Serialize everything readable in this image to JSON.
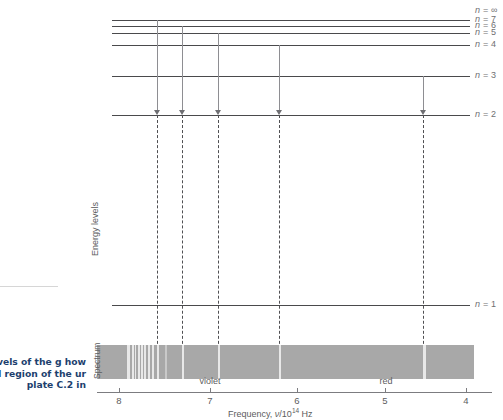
{
  "figure": {
    "energy_axis_label": "Energy levels",
    "spectrum_label": "Spectrum",
    "freq_axis_title_prefix": "Frequency, ",
    "freq_axis_title_nu": "ν",
    "freq_axis_title_denom": "/10",
    "freq_axis_title_exp": "14",
    "freq_axis_title_unit": " Hz",
    "caption": "y levels of the g how coloured region of the ur plate C.2 in"
  },
  "levels": [
    {
      "label_n": "n",
      "label_eq": " = ",
      "label_val": "∞",
      "y": 11,
      "x1": 112,
      "x2": 470,
      "drawn": false
    },
    {
      "label_n": "n",
      "label_eq": " = ",
      "label_val": "7",
      "y": 20,
      "x1": 112,
      "x2": 470,
      "drawn": true
    },
    {
      "label_n": "n",
      "label_eq": " = ",
      "label_val": "6",
      "y": 26,
      "x1": 112,
      "x2": 470,
      "drawn": true
    },
    {
      "label_n": "n",
      "label_eq": " = ",
      "label_val": "5",
      "y": 33,
      "x1": 112,
      "x2": 470,
      "drawn": true
    },
    {
      "label_n": "n",
      "label_eq": " = ",
      "label_val": "4",
      "y": 45,
      "x1": 112,
      "x2": 470,
      "drawn": true
    },
    {
      "label_n": "n",
      "label_eq": " = ",
      "label_val": "3",
      "y": 76,
      "x1": 112,
      "x2": 470,
      "drawn": true
    },
    {
      "label_n": "n",
      "label_eq": " = ",
      "label_val": "2",
      "y": 115,
      "x1": 112,
      "x2": 470,
      "drawn": true
    },
    {
      "label_n": "n",
      "label_eq": " = ",
      "label_val": "1",
      "y": 305,
      "x1": 112,
      "x2": 470,
      "drawn": true
    }
  ],
  "transitions": [
    {
      "name": "n7-to-n2",
      "x": 157,
      "y_top": 20,
      "y_bottom": 115
    },
    {
      "name": "n6-to-n2",
      "x": 182,
      "y_top": 26,
      "y_bottom": 115
    },
    {
      "name": "n5-to-n2",
      "x": 218,
      "y_top": 33,
      "y_bottom": 115
    },
    {
      "name": "n4-to-n2",
      "x": 279,
      "y_top": 45,
      "y_bottom": 115
    },
    {
      "name": "n3-to-n2",
      "x": 423,
      "y_top": 76,
      "y_bottom": 115
    }
  ],
  "droplines": [
    {
      "x": 157,
      "y_top": 115,
      "y_bottom": 379
    },
    {
      "x": 182,
      "y_top": 115,
      "y_bottom": 379
    },
    {
      "x": 218,
      "y_top": 115,
      "y_bottom": 379
    },
    {
      "x": 279,
      "y_top": 115,
      "y_bottom": 379
    },
    {
      "x": 423,
      "y_top": 115,
      "y_bottom": 379
    }
  ],
  "spectrum": {
    "x": 97,
    "y": 345,
    "width": 377,
    "height": 34,
    "lines": [
      {
        "x": 127,
        "w": 3.0,
        "bright": true
      },
      {
        "x": 132,
        "w": 1.6,
        "bright": true
      },
      {
        "x": 135,
        "w": 1.4,
        "bright": true
      },
      {
        "x": 138,
        "w": 1.6,
        "bright": true
      },
      {
        "x": 141,
        "w": 1.6,
        "bright": true
      },
      {
        "x": 144,
        "w": 1.8,
        "bright": true
      },
      {
        "x": 148,
        "w": 2.0,
        "bright": true
      },
      {
        "x": 152,
        "w": 2.2,
        "bright": true
      },
      {
        "x": 157,
        "w": 2.4,
        "bright": true
      },
      {
        "x": 165,
        "w": 2.0,
        "bright": false
      },
      {
        "x": 182,
        "w": 2.2,
        "bright": true
      },
      {
        "x": 218,
        "w": 2.2,
        "bright": true
      },
      {
        "x": 279,
        "w": 2.4,
        "bright": true
      },
      {
        "x": 423,
        "w": 2.6,
        "bright": true
      }
    ]
  },
  "freq_axis": {
    "x1": 97,
    "x2": 492,
    "y": 392,
    "ticks": [
      {
        "label": "8",
        "x": 119
      },
      {
        "label": "7",
        "x": 210
      },
      {
        "label": "6",
        "x": 297
      },
      {
        "label": "5",
        "x": 385
      },
      {
        "label": "4",
        "x": 466
      }
    ]
  },
  "color_words": [
    {
      "label": "violet",
      "x": 210,
      "y": 376
    },
    {
      "label": "red",
      "x": 386,
      "y": 376
    }
  ]
}
